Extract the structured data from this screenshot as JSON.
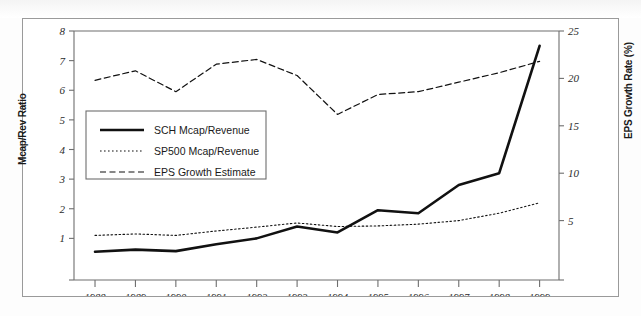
{
  "chart_data": {
    "type": "line",
    "title": "",
    "xlabel": "",
    "ylabel": "Mcap/Rev Ratio",
    "y2label": "EPS Growth Rate (%)",
    "categories": [
      "1988",
      "1989",
      "1990",
      "1991",
      "1992",
      "1993",
      "1994",
      "1995",
      "1996",
      "1997",
      "1998",
      "1999"
    ],
    "ylim": [
      0,
      8
    ],
    "y2lim": [
      0,
      25
    ],
    "yticks": [
      "1",
      "2",
      "3",
      "4",
      "5",
      "6",
      "7",
      "8"
    ],
    "y2ticks": [
      "5",
      "10",
      "15",
      "20",
      "25"
    ],
    "grid": false,
    "legend_position": "center-left",
    "series": [
      {
        "name": "SCH Mcap/Revenue",
        "axis": "left",
        "style": "solid",
        "values": [
          0.55,
          0.62,
          0.57,
          0.8,
          1.0,
          1.4,
          1.2,
          1.95,
          1.85,
          2.8,
          3.2,
          7.5
        ]
      },
      {
        "name": "SP500 Mcap/Revenue",
        "axis": "left",
        "style": "dotted",
        "values": [
          1.1,
          1.15,
          1.1,
          1.25,
          1.38,
          1.52,
          1.4,
          1.42,
          1.48,
          1.6,
          1.85,
          2.2
        ]
      },
      {
        "name": "EPS Growth Estimate",
        "axis": "right",
        "style": "dashed",
        "values": [
          19.8,
          20.8,
          18.6,
          21.5,
          22.0,
          20.3,
          16.2,
          18.3,
          18.6,
          19.6,
          20.6,
          21.8
        ]
      }
    ]
  },
  "legend": {
    "items": [
      {
        "label": "SCH Mcap/Revenue",
        "style": "solid"
      },
      {
        "label": "SP500 Mcap/Revenue",
        "style": "dotted"
      },
      {
        "label": "EPS Growth Estimate",
        "style": "dashed"
      }
    ]
  },
  "colors": {
    "line": "#111111",
    "axis": "#6e6e6e",
    "frame": "#9a9a9a",
    "text": "#1a1a1a",
    "background": "#ffffff"
  }
}
